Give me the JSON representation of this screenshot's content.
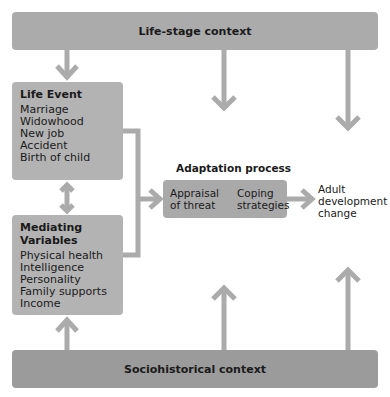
{
  "top_context": {
    "label": "Life-stage context"
  },
  "bottom_context": {
    "label": "Sociohistorical context"
  },
  "life_event": {
    "title": "Life Event",
    "items": [
      "Marriage",
      "Widowhood",
      "New job",
      "Accident",
      "Birth of child"
    ]
  },
  "mediating": {
    "title_line1": "Mediating",
    "title_line2": "Variables",
    "items": [
      "Physical health",
      "Intelligence",
      "Personality",
      "Family supports",
      "Income"
    ]
  },
  "adaptation": {
    "title": "Adaptation process",
    "step1_line1": "Appraisal",
    "step1_line2": "of threat",
    "step2_line1": "Coping",
    "step2_line2": "strategies"
  },
  "outcome": {
    "line1": "Adult",
    "line2": "development",
    "line3": "change"
  },
  "colors": {
    "box_fill": "#b3b3b3",
    "bar_fill": "#a7a7a7",
    "arrow": "#aaaaaa"
  }
}
